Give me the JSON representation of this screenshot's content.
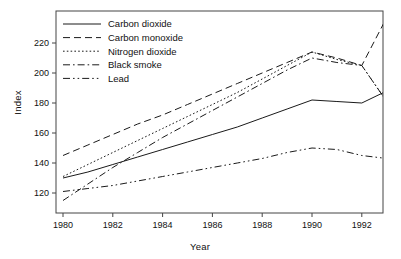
{
  "chart_data": {
    "type": "line",
    "title": "",
    "xlabel": "Year",
    "ylabel": "Index",
    "xlim": [
      1980,
      1993
    ],
    "ylim": [
      112,
      240
    ],
    "grid": false,
    "legend_position": "top-left",
    "xticks": [
      1980,
      1982,
      1984,
      1986,
      1988,
      1990,
      1992
    ],
    "yticks": [
      120,
      140,
      160,
      180,
      200,
      220
    ],
    "x": [
      1980,
      1981,
      1982,
      1983,
      1984,
      1985,
      1986,
      1987,
      1988,
      1989,
      1990,
      1991,
      1992,
      1993
    ],
    "series": [
      {
        "name": "Carbon dioxide",
        "style": "solid",
        "values": [
          130,
          134,
          139,
          144,
          149,
          154,
          159,
          164,
          170,
          176,
          182,
          181,
          180,
          188
        ]
      },
      {
        "name": "Carbon monoxide",
        "style": "dashed",
        "values": [
          145,
          152,
          159,
          166,
          172,
          179,
          186,
          193,
          200,
          207,
          214,
          210,
          205,
          237
        ]
      },
      {
        "name": "Nitrogen dioxide",
        "style": "dotted",
        "values": [
          131,
          139,
          147,
          155,
          163,
          171,
          179,
          187,
          196,
          205,
          214,
          209,
          205,
          181
        ]
      },
      {
        "name": "Black smoke",
        "style": "dash-dot",
        "values": [
          115,
          126,
          137,
          147,
          157,
          166,
          175,
          184,
          193,
          202,
          210,
          207,
          205,
          181
        ]
      },
      {
        "name": "Lead",
        "style": "dash-dot-dot",
        "values": [
          121,
          123,
          125,
          128,
          131,
          134,
          137,
          140,
          143,
          147,
          150,
          149,
          145,
          143
        ]
      }
    ]
  },
  "legend": {
    "items": [
      {
        "label": "Carbon dioxide"
      },
      {
        "label": "Carbon monoxide"
      },
      {
        "label": "Nitrogen dioxide"
      },
      {
        "label": "Black smoke"
      },
      {
        "label": "Lead"
      }
    ]
  },
  "axes": {
    "x_title": "Year",
    "y_title": "Index"
  }
}
